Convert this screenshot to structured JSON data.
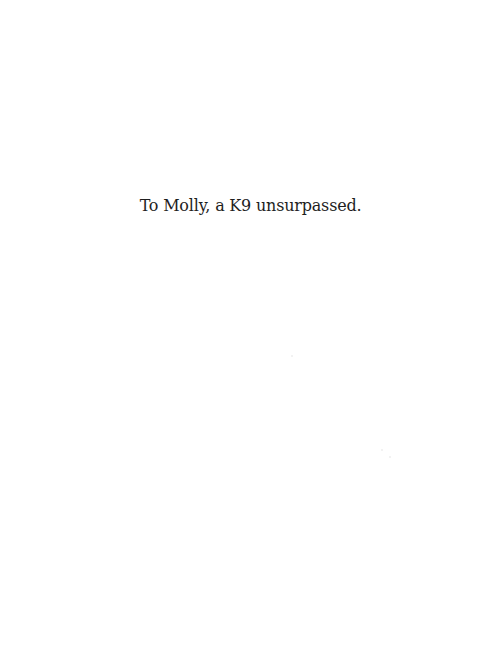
{
  "page": {
    "type": "dedication",
    "dedication_text": "To Molly, a K9 unsurpassed."
  }
}
